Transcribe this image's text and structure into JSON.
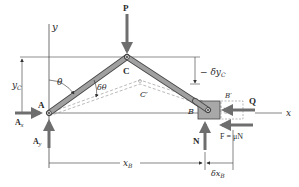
{
  "diagram": {
    "type": "mechanism-virtual-work",
    "colors": {
      "background": "#ffffff",
      "line": "#333333",
      "link_fill": "#9a9a9a",
      "link_stroke": "#4a4a4a",
      "arrow": "#6e6e6e",
      "block_fill": "#a8a8a8",
      "dashed": "#8a8a8a"
    },
    "labels": {
      "y_axis": "y",
      "x_axis": "x",
      "P": "P",
      "C": "C",
      "C_prime": "C′",
      "A": "A",
      "B": "B",
      "B_prime": "B′",
      "Q": "Q",
      "theta": "θ",
      "delta_theta": "δθ",
      "y_c": "y",
      "y_c_sub": "C",
      "neg_delta_yc": "− δy",
      "neg_delta_yc_sub": "C",
      "Ax": "A",
      "Ax_sub": "x",
      "Ay": "A",
      "Ay_sub": "y",
      "N": "N",
      "F_eq": "F = μN",
      "x_b": "x",
      "x_b_sub": "B",
      "delta_x_b": "δx",
      "delta_x_b_sub": "B"
    },
    "points": {
      "A": [
        49,
        113
      ],
      "C": [
        127,
        57
      ],
      "B": [
        208,
        110
      ],
      "C_prime": [
        140,
        80
      ],
      "B_prime": [
        230,
        110
      ]
    }
  }
}
